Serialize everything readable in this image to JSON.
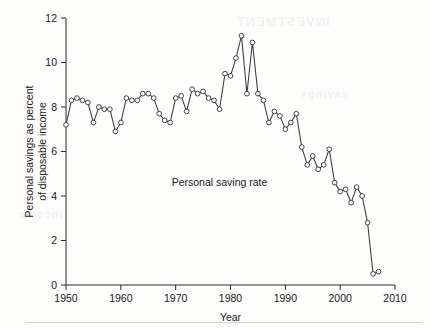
{
  "chart_data": {
    "type": "line",
    "title": "",
    "xlabel": "Year",
    "ylabel": "Personal savings as percent of disposable income",
    "ylabel_line1": "Personal savings as percent",
    "ylabel_line2": "of disposable income",
    "xlim": [
      1950,
      2010
    ],
    "ylim": [
      0,
      12
    ],
    "xticks": [
      1950,
      1960,
      1970,
      1980,
      1990,
      2000,
      2010
    ],
    "xticklabels": [
      "1950",
      "1960",
      "1970",
      "1980",
      "1990",
      "2000",
      "2010"
    ],
    "yticks": [
      0,
      2,
      4,
      6,
      8,
      10,
      12
    ],
    "yticklabels": [
      "0",
      "2",
      "4",
      "6",
      "8",
      "10",
      "12"
    ],
    "grid": false,
    "legend": false,
    "marker": "open-circle",
    "line_color": "#3a3a3a",
    "marker_face_color": "#ffffff",
    "annotations": [
      {
        "text": "Personal saving rate",
        "x": 1978.0,
        "y": 4.45,
        "name": "series-annotation"
      }
    ],
    "series": [
      {
        "name": "Personal saving rate",
        "x": [
          1950,
          1951,
          1952,
          1953,
          1954,
          1955,
          1956,
          1957,
          1958,
          1959,
          1960,
          1961,
          1962,
          1963,
          1964,
          1965,
          1966,
          1967,
          1968,
          1969,
          1970,
          1971,
          1972,
          1973,
          1974,
          1975,
          1976,
          1977,
          1978,
          1979,
          1980,
          1981,
          1982,
          1983,
          1984,
          1985,
          1986,
          1987,
          1988,
          1989,
          1990,
          1991,
          1992,
          1993,
          1994,
          1995,
          1996,
          1997,
          1998,
          1999,
          2000,
          2001,
          2002,
          2003,
          2004,
          2005,
          2006,
          2007
        ],
        "values": [
          7.2,
          8.3,
          8.4,
          8.3,
          8.2,
          7.3,
          8.0,
          7.9,
          7.9,
          6.9,
          7.3,
          8.4,
          8.3,
          8.3,
          8.6,
          8.6,
          8.4,
          7.7,
          7.4,
          7.3,
          8.4,
          8.5,
          7.8,
          8.8,
          8.6,
          8.7,
          8.4,
          8.3,
          7.9,
          9.5,
          9.4,
          10.2,
          11.2,
          8.6,
          10.9,
          8.6,
          8.3,
          7.3,
          7.8,
          7.6,
          7.0,
          7.3,
          7.7,
          6.2,
          5.4,
          5.8,
          5.2,
          5.4,
          6.1,
          4.6,
          4.2,
          4.3,
          3.7,
          4.4,
          4.0,
          2.8,
          0.5,
          0.6
        ]
      }
    ]
  },
  "figure": {
    "background_color": "#fdfdfc",
    "watermark_a": "INVESTMENT",
    "watermark_b": "savings",
    "watermark_c": "income"
  }
}
